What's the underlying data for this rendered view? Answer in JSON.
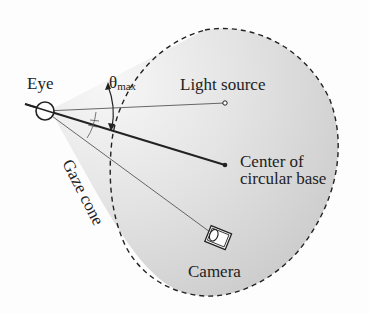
{
  "diagram": {
    "labels": {
      "eye": "Eye",
      "theta": "θ",
      "theta_sub": "max",
      "light_source": "Light source",
      "center_line1": "Center of",
      "center_line2": "circular base",
      "gaze_cone": "Gaze cone",
      "camera": "Camera"
    },
    "colors": {
      "cone_light": "#f4f4f4",
      "cone_dark": "#c8c8c8",
      "line": "#222222",
      "background": "#fdfdfd"
    }
  }
}
